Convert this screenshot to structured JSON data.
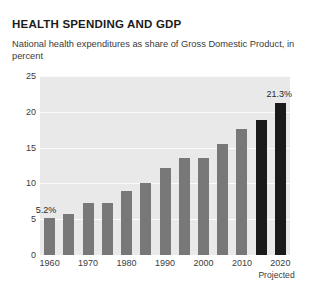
{
  "chart_data": {
    "type": "bar",
    "title": "HEALTH SPENDING AND GDP",
    "subtitle": "National health expenditures as share of Gross Domestic Product, in percent",
    "xlabel": "",
    "ylabel": "in percent",
    "ylim": [
      0,
      25
    ],
    "yticks": [
      "0",
      "5",
      "10",
      "15",
      "20",
      "25"
    ],
    "ytick_values": [
      0,
      5,
      10,
      15,
      20,
      25
    ],
    "grid": true,
    "legend": "none",
    "xtick_labels": [
      "1960",
      "1970",
      "1980",
      "1990",
      "2000",
      "2010",
      "2020"
    ],
    "xtick_years": [
      1960,
      1970,
      1980,
      1990,
      2000,
      2010,
      2020
    ],
    "projected_note": "Projected",
    "categories": [
      1960,
      1965,
      1970,
      1975,
      1980,
      1985,
      1990,
      1995,
      2000,
      2005,
      2010,
      2015,
      2020
    ],
    "values": [
      5.2,
      5.7,
      7.2,
      7.3,
      8.9,
      10.1,
      12.1,
      13.6,
      13.6,
      15.5,
      17.6,
      18.8,
      21.3
    ],
    "projected_flags": [
      false,
      false,
      false,
      false,
      false,
      false,
      false,
      false,
      false,
      false,
      false,
      true,
      true
    ],
    "data_labels": [
      {
        "category": 1960,
        "text": "5.2%"
      },
      {
        "category": 2020,
        "text": "21.3%"
      }
    ],
    "colors": {
      "bar": "#787878",
      "bar_projected": "#1a1a1a",
      "plot_background": "#e9e9e9",
      "gridline": "#fbfbfb",
      "text": "#3c3c3c",
      "title": "#1b1b1b",
      "page_background": "#ffffff"
    }
  }
}
